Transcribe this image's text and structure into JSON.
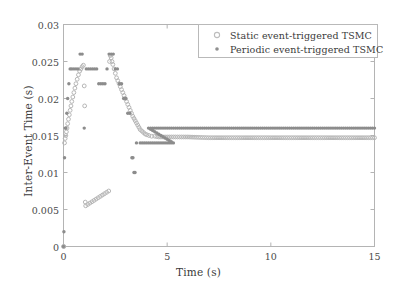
{
  "chart_data": {
    "type": "scatter",
    "title": "",
    "xlabel": "Time (s)",
    "ylabel": "Inter-Event Time (s)",
    "xlim": [
      0,
      15
    ],
    "ylim": [
      0,
      0.03
    ],
    "xticks": [
      0,
      5,
      10,
      15
    ],
    "xtick_labels": [
      "0",
      "5",
      "10",
      "15"
    ],
    "yticks": [
      0,
      0.005,
      0.01,
      0.015,
      0.02,
      0.025,
      0.03
    ],
    "ytick_labels": [
      "0",
      "0.005",
      "0.01",
      "0.015",
      "0.02",
      "0.025",
      "0.03"
    ],
    "grid": false,
    "legend_position": "top-right",
    "series": [
      {
        "name": "Static event-triggered TSMC",
        "marker": "open-circle",
        "color": "#b6b6b6",
        "points": [
          [
            0.0,
            0.0
          ],
          [
            0.02,
            0.0
          ],
          [
            0.05,
            0.014
          ],
          [
            0.08,
            0.0146
          ],
          [
            0.11,
            0.015
          ],
          [
            0.14,
            0.0155
          ],
          [
            0.17,
            0.016
          ],
          [
            0.2,
            0.0166
          ],
          [
            0.24,
            0.0172
          ],
          [
            0.28,
            0.0178
          ],
          [
            0.32,
            0.0184
          ],
          [
            0.36,
            0.019
          ],
          [
            0.4,
            0.0196
          ],
          [
            0.45,
            0.0202
          ],
          [
            0.5,
            0.0208
          ],
          [
            0.55,
            0.0214
          ],
          [
            0.6,
            0.022
          ],
          [
            0.66,
            0.0226
          ],
          [
            0.72,
            0.0232
          ],
          [
            0.78,
            0.0237
          ],
          [
            0.84,
            0.024
          ],
          [
            0.9,
            0.0243
          ],
          [
            0.96,
            0.0245
          ],
          [
            1.0,
            0.0217
          ],
          [
            1.02,
            0.019
          ],
          [
            1.05,
            0.006
          ],
          [
            1.07,
            0.0055
          ],
          [
            2.18,
            0.0075
          ],
          [
            2.22,
            0.025
          ],
          [
            2.26,
            0.0258
          ],
          [
            2.3,
            0.0255
          ],
          [
            2.34,
            0.025
          ],
          [
            2.38,
            0.0246
          ],
          [
            2.44,
            0.024
          ],
          [
            2.5,
            0.0234
          ],
          [
            2.56,
            0.0228
          ],
          [
            2.62,
            0.0224
          ],
          [
            2.68,
            0.022
          ],
          [
            2.74,
            0.0216
          ],
          [
            2.8,
            0.0212
          ],
          [
            2.86,
            0.0208
          ],
          [
            2.92,
            0.0204
          ],
          [
            2.98,
            0.02
          ],
          [
            3.04,
            0.0196
          ],
          [
            3.1,
            0.0192
          ],
          [
            3.16,
            0.0188
          ],
          [
            3.22,
            0.0184
          ],
          [
            3.28,
            0.018
          ],
          [
            3.34,
            0.0176
          ],
          [
            3.4,
            0.0173
          ],
          [
            3.46,
            0.017
          ],
          [
            3.52,
            0.0167
          ],
          [
            3.58,
            0.0164
          ],
          [
            3.64,
            0.0161
          ],
          [
            3.7,
            0.0158
          ],
          [
            3.78,
            0.0156
          ],
          [
            3.86,
            0.0154
          ],
          [
            3.94,
            0.0152
          ],
          [
            4.02,
            0.0151
          ],
          [
            4.12,
            0.015
          ],
          [
            4.25,
            0.0149
          ],
          [
            4.4,
            0.0149
          ],
          [
            4.6,
            0.0148
          ],
          [
            5.0,
            0.0148
          ],
          [
            5.5,
            0.0148
          ],
          [
            6.0,
            0.0148
          ],
          [
            7.0,
            0.0147
          ],
          [
            8.0,
            0.0147
          ],
          [
            9.0,
            0.0147
          ],
          [
            10.0,
            0.0147
          ],
          [
            11.0,
            0.0147
          ],
          [
            12.0,
            0.0147
          ],
          [
            13.0,
            0.0147
          ],
          [
            14.0,
            0.0147
          ],
          [
            15.0,
            0.0147
          ]
        ]
      },
      {
        "name": "Periodic event-triggered TSMC",
        "marker": "filled-dot",
        "color": "#8c8c8c",
        "points": [
          [
            0.0,
            0.0
          ],
          [
            0.02,
            0.002
          ],
          [
            0.05,
            0.012
          ],
          [
            0.08,
            0.016
          ],
          [
            0.12,
            0.016
          ],
          [
            0.16,
            0.018
          ],
          [
            0.2,
            0.02
          ],
          [
            0.26,
            0.022
          ],
          [
            0.32,
            0.024
          ],
          [
            0.4,
            0.024
          ],
          [
            0.5,
            0.024
          ],
          [
            0.6,
            0.024
          ],
          [
            0.7,
            0.024
          ],
          [
            0.8,
            0.026
          ],
          [
            0.9,
            0.026
          ],
          [
            1.0,
            0.016
          ],
          [
            1.1,
            0.024
          ],
          [
            1.2,
            0.024
          ],
          [
            1.3,
            0.024
          ],
          [
            1.4,
            0.024
          ],
          [
            1.5,
            0.024
          ],
          [
            1.6,
            0.024
          ],
          [
            1.7,
            0.022
          ],
          [
            1.8,
            0.022
          ],
          [
            1.9,
            0.022
          ],
          [
            2.0,
            0.022
          ],
          [
            2.2,
            0.026
          ],
          [
            2.3,
            0.026
          ],
          [
            2.4,
            0.026
          ],
          [
            2.5,
            0.024
          ],
          [
            2.6,
            0.024
          ],
          [
            2.7,
            0.022
          ],
          [
            2.8,
            0.022
          ],
          [
            2.9,
            0.02
          ],
          [
            3.0,
            0.02
          ],
          [
            3.1,
            0.018
          ],
          [
            3.2,
            0.018
          ],
          [
            3.3,
            0.012
          ],
          [
            3.35,
            0.012
          ],
          [
            3.4,
            0.01
          ],
          [
            3.45,
            0.01
          ],
          [
            3.52,
            0.014
          ],
          [
            3.7,
            0.014
          ],
          [
            3.9,
            0.014
          ],
          [
            4.2,
            0.014
          ],
          [
            4.6,
            0.014
          ],
          [
            5.0,
            0.014
          ],
          [
            5.3,
            0.014
          ],
          [
            4.1,
            0.016
          ],
          [
            4.5,
            0.016
          ],
          [
            5.0,
            0.016
          ],
          [
            6.0,
            0.016
          ],
          [
            7.0,
            0.016
          ],
          [
            8.0,
            0.016
          ],
          [
            9.0,
            0.016
          ],
          [
            10.0,
            0.016
          ],
          [
            11.0,
            0.016
          ],
          [
            12.0,
            0.016
          ],
          [
            13.0,
            0.016
          ],
          [
            14.0,
            0.016
          ],
          [
            15.0,
            0.016
          ]
        ]
      }
    ],
    "colors": {
      "static_marker": "#b6b6b6",
      "periodic_marker": "#8c8c8c",
      "axis": "#b0b0b0",
      "text": "#3a3a3a",
      "background": "#ffffff"
    }
  },
  "legend": {
    "entries": [
      {
        "label": "Static event-triggered TSMC",
        "symbol": "open-circle"
      },
      {
        "label": "Periodic event-triggered TSMC",
        "symbol": "filled-dot"
      }
    ]
  },
  "axes": {
    "xlabel": "Time (s)",
    "ylabel": "Inter-Event Time (s)",
    "xtick_labels": [
      "0",
      "5",
      "10",
      "15"
    ],
    "ytick_labels": [
      "0",
      "0.005",
      "0.01",
      "0.015",
      "0.02",
      "0.025",
      "0.03"
    ]
  }
}
